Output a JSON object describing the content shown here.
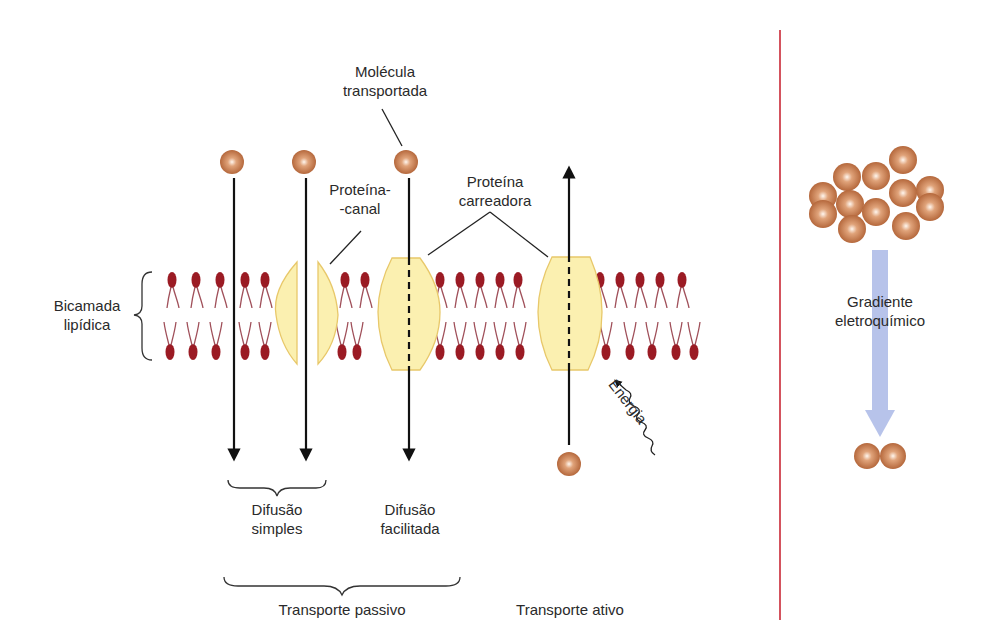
{
  "labels": {
    "molecule": [
      "Molécula",
      "transportada"
    ],
    "channel_protein": [
      "Proteína-",
      "-canal"
    ],
    "carrier_protein": [
      "Proteína",
      "carreadora"
    ],
    "lipid_bilayer": [
      "Bicamada",
      "lipídica"
    ],
    "energy": "Energia",
    "simple_diffusion": [
      "Difusão",
      "simples"
    ],
    "facilitated_diffusion": [
      "Difusão",
      "facilitada"
    ],
    "passive_transport": "Transporte passivo",
    "active_transport": "Transporte ativo",
    "gradient": [
      "Gradiente",
      "eletroquímico"
    ]
  },
  "colors": {
    "lipid_head": "#9b1b24",
    "lipid_tail": "#a0505a",
    "protein_fill": "#fbf0b0",
    "protein_stroke": "#e8c86a",
    "molecule": "#c0784a",
    "divider": "#d0404c",
    "gradient_arrow": "#aab8e6",
    "text": "#2a2a2a"
  }
}
